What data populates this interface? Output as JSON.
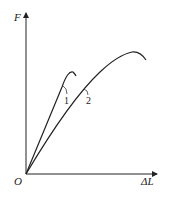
{
  "diagram": {
    "y_axis_label": "F",
    "x_axis_label": "ΔL",
    "origin_label": "O",
    "curves": [
      {
        "id": "1",
        "label": "1",
        "description": "steeper curve, lower peak, shorter elongation"
      },
      {
        "id": "2",
        "label": "2",
        "description": "less steep curve, higher peak, longer elongation"
      }
    ],
    "colors": {
      "line": "#222222",
      "background": "#ffffff"
    }
  }
}
